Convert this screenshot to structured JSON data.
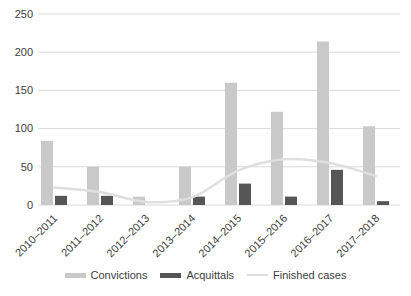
{
  "chart_data": {
    "type": "bar",
    "title": "",
    "categories": [
      "2010–2011",
      "2011–2012",
      "2012–2013",
      "2013–2014",
      "2014–2015",
      "2015–2016",
      "2016–2017",
      "2017–2018"
    ],
    "series": [
      {
        "name": "Convictions",
        "type": "bar",
        "color": "#c9c9c9",
        "values": [
          84,
          50,
          11,
          50,
          160,
          122,
          214,
          103
        ]
      },
      {
        "name": "Acquittals",
        "type": "bar",
        "color": "#565656",
        "values": [
          12,
          12,
          0,
          11,
          28,
          11,
          46,
          5
        ]
      },
      {
        "name": "Finished cases",
        "type": "line",
        "color": "#dfdfdf",
        "values": [
          23,
          17,
          4,
          10,
          45,
          60,
          55,
          38
        ]
      }
    ],
    "xlabel": "",
    "ylabel": "",
    "ylim": [
      0,
      250
    ],
    "yticks": [
      0,
      50,
      100,
      150,
      200,
      250
    ],
    "grid": true,
    "gridcolor": "#d9d9d9",
    "axis_text_color": "#3d3d3d",
    "legend_position": "bottom"
  }
}
